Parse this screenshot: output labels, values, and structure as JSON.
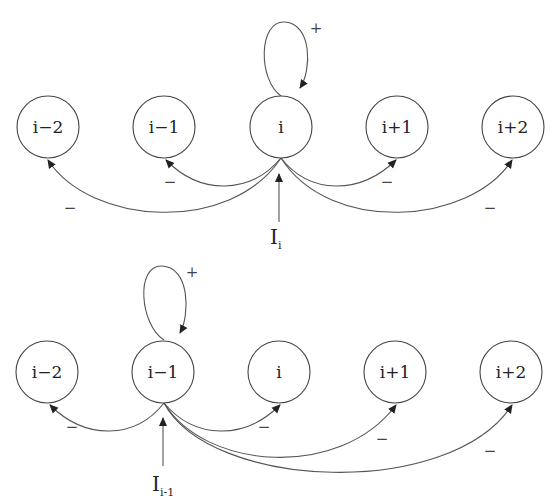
{
  "diagrams": [
    {
      "name": "top-network",
      "nodes": [
        "i−2",
        "i−1",
        "i",
        "i+1",
        "i+2"
      ],
      "active_node": "i",
      "self_loop_sign": "+",
      "edge_signs": {
        "to_i_minus_2": "−",
        "to_i_minus_1": "−",
        "to_i_plus_1": "−",
        "to_i_plus_2": "−"
      },
      "input_label": "I",
      "input_subscript": "i"
    },
    {
      "name": "bottom-network",
      "nodes": [
        "i−2",
        "i−1",
        "i",
        "i+1",
        "i+2"
      ],
      "active_node": "i−1",
      "self_loop_sign": "+",
      "edge_signs": {
        "to_i_minus_2": "−",
        "to_i": "−",
        "to_i_plus_1": "−",
        "to_i_plus_2": "−"
      },
      "input_label": "I",
      "input_subscript": "i-1"
    }
  ]
}
